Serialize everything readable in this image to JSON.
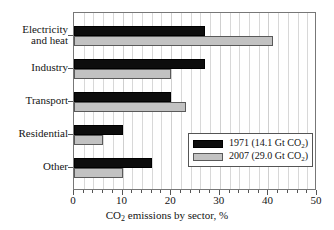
{
  "chart_data": {
    "type": "bar",
    "orientation": "horizontal",
    "title": "",
    "xlabel": "CO2 emissions by sector, %",
    "xlabel_parts": {
      "pre": "CO",
      "sub": "2",
      "post": " emissions by sector, %"
    },
    "ylabel": "",
    "categories": [
      "Electricity and heat",
      "Industry",
      "Transport",
      "Residential",
      "Other"
    ],
    "category_labels": [
      "Electricity\nand heat",
      "Industry",
      "Transport",
      "Residential",
      "Other"
    ],
    "series": [
      {
        "name": "1971 (14.1 Gt CO2)",
        "name_parts": {
          "pre": "1971 (14.1 Gt CO",
          "sub": "2",
          "post": ")"
        },
        "color": "#0d0d0d",
        "values": [
          27,
          27,
          20,
          10,
          16
        ]
      },
      {
        "name": "2007 (29.0 Gt CO2)",
        "name_parts": {
          "pre": "2007 (29.0 Gt CO",
          "sub": "2",
          "post": ")"
        },
        "color": "#c2c2c2",
        "values": [
          41,
          20,
          23,
          6,
          10
        ]
      }
    ],
    "xlim": [
      0,
      50
    ],
    "xticks": [
      0,
      10,
      20,
      30,
      40,
      50
    ],
    "xtick_labels": [
      "0",
      "10",
      "20",
      "30",
      "40",
      "50"
    ],
    "xminor_step": 2,
    "grid": true,
    "grid_axis": "x",
    "legend_position": "lower right"
  }
}
